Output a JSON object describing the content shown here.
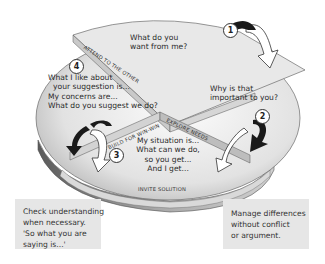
{
  "diagram": {
    "quadrants": [
      {
        "step": "1",
        "text_lines": [
          "What do you",
          "want from me?"
        ]
      },
      {
        "step": "2",
        "text_lines": [
          "Why is that",
          "important to you?"
        ]
      },
      {
        "step": "3",
        "text_lines": [
          "My situation is...",
          "What can we do,",
          "so you get...",
          "And I get..."
        ]
      },
      {
        "step": "4",
        "text_lines": [
          "What I like about",
          "your suggestion is...",
          "My concerns are...",
          "What do you suggest we do?"
        ]
      }
    ],
    "band_labels": {
      "attend": "Attend to the other",
      "explore": "Explore needs",
      "build": "Build for win-win",
      "invite": "Invite solution"
    },
    "notes": {
      "left": [
        "Check understanding",
        "when necessary.",
        "'So what you are",
        "saying is...'"
      ],
      "right": [
        "Manage differences",
        "without conflict",
        "or argument."
      ]
    },
    "colors": {
      "top_light": "#f4f4f4",
      "top_dark": "#9a9a9a",
      "side": "#8a8a8a",
      "band": "#d8d8d8",
      "arrow_dark": "#1a1a1a",
      "note_bg": "#e6e6e6"
    }
  }
}
